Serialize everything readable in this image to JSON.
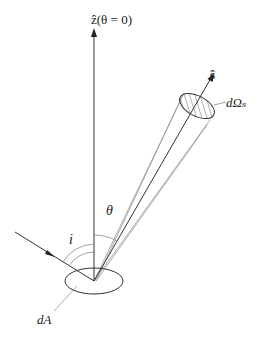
{
  "diagram": {
    "type": "radiometry-geometry",
    "labels": {
      "z_axis": "ẑ(θ = 0)",
      "direction": "ŝ",
      "solid_angle": "dΩₛ",
      "zenith_angle": "θ",
      "incidence_angle": "i",
      "area_element": "dA"
    },
    "colors": {
      "line": "#333333",
      "thin_line": "#777777",
      "hatch": "#555555",
      "background": "#ffffff"
    },
    "elements": [
      {
        "name": "z-axis",
        "kind": "arrow",
        "from": [
          94,
          281
        ],
        "to": [
          94,
          30
        ]
      },
      {
        "name": "s-vector",
        "kind": "arrow",
        "from": [
          94,
          281
        ],
        "to": [
          213,
          74
        ]
      },
      {
        "name": "incident-ray",
        "kind": "arrow",
        "from": [
          15,
          232
        ],
        "to": [
          94,
          281
        ]
      },
      {
        "name": "solid-angle-ellipse",
        "kind": "hatched-ellipse",
        "center": [
          197,
          106
        ],
        "rx": 19,
        "ry": 10
      },
      {
        "name": "area-ellipse",
        "kind": "ellipse",
        "center": [
          94,
          281
        ],
        "rx": 29,
        "ry": 13
      },
      {
        "name": "theta-arc",
        "kind": "arc"
      },
      {
        "name": "i-arcs",
        "kind": "double-arc"
      }
    ]
  }
}
